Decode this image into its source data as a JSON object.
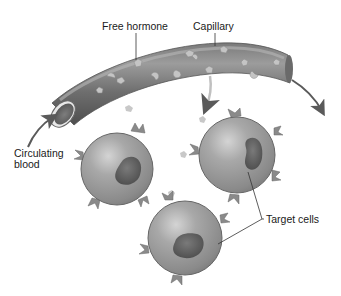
{
  "labels": {
    "free_hormone": "Free hormone",
    "capillary": "Capillary",
    "circulating_blood_line1": "Circulating",
    "circulating_blood_line2": "blood",
    "target_cells": "Target cells"
  },
  "colors": {
    "background": "#ffffff",
    "capillary_dark": "#5e5e5e",
    "capillary_mid": "#8a8a8a",
    "capillary_light": "#b0b0b0",
    "cell_fill": "#9a9a9a",
    "cell_highlight": "#cfcfcf",
    "nucleus": "#5a5a5a",
    "hormone": "#bdbdbd",
    "arrow": "#5a5a5a",
    "leader_line": "#333333",
    "text": "#1a1a1a"
  },
  "elements": {
    "capillary_count": 1,
    "target_cell_count": 3,
    "flow_arrows": [
      "inflow-left",
      "outflow-right"
    ]
  }
}
